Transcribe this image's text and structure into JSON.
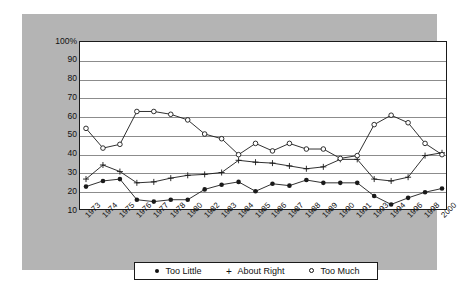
{
  "chart_data": {
    "type": "line",
    "title": "",
    "xlabel": "",
    "ylabel": "",
    "ylim": [
      10,
      100
    ],
    "ytick_labels": [
      "100%",
      "90",
      "80",
      "70",
      "60",
      "50",
      "40",
      "30",
      "20",
      "10"
    ],
    "ytick_values": [
      100,
      90,
      80,
      70,
      60,
      50,
      40,
      30,
      20,
      10
    ],
    "grid": true,
    "legend_position": "bottom",
    "categories": [
      "1973",
      "1974",
      "1975",
      "1976",
      "1977",
      "1978",
      "1980",
      "1982",
      "1983",
      "1984",
      "1985",
      "1986",
      "1987",
      "1988",
      "1989",
      "1990",
      "1991",
      "1993",
      "1994",
      "1996",
      "1998",
      "2000"
    ],
    "series": [
      {
        "name": "Too Little",
        "marker": "filled-circle",
        "values": [
          23,
          26,
          27,
          16,
          15,
          16,
          16,
          21.5,
          24,
          25.5,
          20.5,
          24.5,
          23.5,
          26.5,
          25,
          25,
          25,
          18,
          13.5,
          17,
          20,
          22
        ]
      },
      {
        "name": "About Right",
        "marker": "plus",
        "values": [
          27,
          34.5,
          31,
          25,
          25.5,
          27.5,
          29,
          29.5,
          30.5,
          37,
          36,
          35.5,
          34,
          32.5,
          33.5,
          37.5,
          37.5,
          27,
          26,
          28,
          39.5,
          41
        ]
      },
      {
        "name": "Too Much",
        "marker": "open-circle",
        "values": [
          54,
          43.5,
          45.5,
          63,
          63,
          61.5,
          58.5,
          51,
          48.5,
          40,
          46,
          42,
          46,
          43,
          43,
          38,
          39.5,
          56,
          61,
          57,
          46,
          40
        ]
      }
    ]
  },
  "legend": {
    "items": [
      {
        "label": "Too Little",
        "marker": "filled-circle"
      },
      {
        "label": "About Right",
        "marker": "plus"
      },
      {
        "label": "Too Much",
        "marker": "open-circle"
      }
    ]
  },
  "colors": {
    "panel_background": "#b4b4b4",
    "plot_background": "#ffffff",
    "axis": "#1a1a1a",
    "grid": "#8c8c8c",
    "series": "#1a1a1a",
    "page_background": "#ffffff"
  }
}
